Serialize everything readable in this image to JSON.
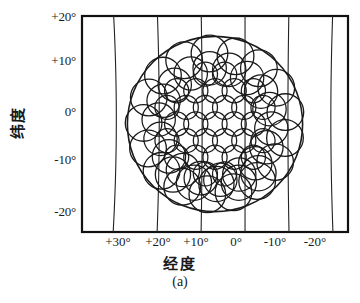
{
  "figure": {
    "caption": "(a)",
    "x_axis": {
      "title": "经度",
      "title_meaning": "longitude",
      "ticks": [
        "+30°",
        "+20°",
        "+10°",
        "0°",
        "-10°",
        "-20°"
      ]
    },
    "y_axis": {
      "title": "纬度",
      "title_meaning": "latitude",
      "ticks": [
        "+20°",
        "+10°",
        "0°",
        "-10°",
        "-20°"
      ]
    }
  },
  "chart_data": {
    "type": "scatter",
    "title": "",
    "subtitle": "",
    "xlabel": "经度",
    "ylabel": "纬度",
    "xlim": [
      38,
      -24
    ],
    "ylim": [
      -24,
      22
    ],
    "xticks": [
      30,
      20,
      10,
      0,
      -10,
      -20
    ],
    "xticklabels": [
      "+30°",
      "+20°",
      "+10°",
      "0°",
      "-10°",
      "-20°"
    ],
    "yticks": [
      20,
      10,
      0,
      -10,
      -20
    ],
    "yticklabels": [
      "+20°",
      "+10°",
      "0°",
      "-10°",
      "-20°"
    ],
    "grid": true,
    "grid_style": "curved meridian lines only (vertical), no horizontal gridlines",
    "legend": "none",
    "annotations": [
      "(a)"
    ],
    "series": [
      {
        "name": "coverage-boundary",
        "kind": "circle-outline",
        "center": [
          7.0,
          -1.0
        ],
        "radius_deg": 19.5,
        "stroke": "#1a1a1a"
      },
      {
        "name": "spot-beams-outer",
        "kind": "circle-outlines",
        "radius_deg": 4.0,
        "count": 18,
        "stroke": "#1a1a1a"
      },
      {
        "name": "spot-beams-middle",
        "kind": "circle-outlines",
        "radius_deg": 3.2,
        "count": 18,
        "stroke": "#1a1a1a"
      },
      {
        "name": "spot-beams-inner",
        "kind": "circle-outlines",
        "radius_deg": 2.4,
        "count": 25,
        "stroke": "#1a1a1a"
      }
    ],
    "colors": {
      "stroke": "#1a1a1a",
      "background": "#ffffff",
      "frame": "#111111"
    }
  }
}
